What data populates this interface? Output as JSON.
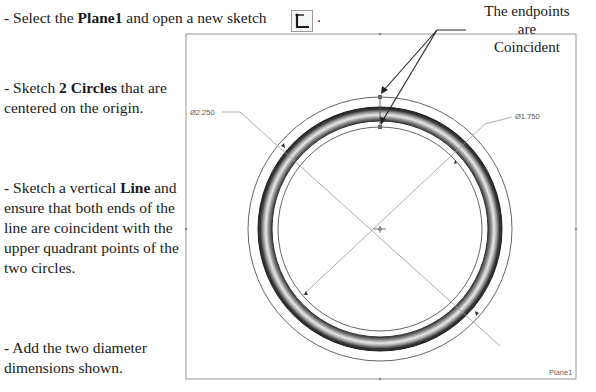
{
  "instructions": {
    "step1": {
      "prefix": "- Select the ",
      "bold": "Plane1",
      "suffix": " and open a new sketch",
      "icon": "sketch-icon",
      "end": "."
    },
    "step2": {
      "prefix": "- Sketch ",
      "bold": "2 Circles",
      "suffix": " that are centered on the origin."
    },
    "step3": {
      "prefix": "- Sketch a vertical ",
      "bold": "Line",
      "suffix": " and ensure that both ends of the line are coincident with the upper quadrant points of the two circles."
    },
    "step4": {
      "text": "- Add the two diameter dimensions shown."
    }
  },
  "callout": {
    "line1": "The endpoints",
    "line2": "are",
    "line3": "Coincident"
  },
  "drawing": {
    "outer_dimension": "Ø2.250",
    "inner_dimension": "Ø1.750",
    "plane_label": "Plane1",
    "colors": {
      "plane_border": "#8c8c8c",
      "sketch_line": "#6e6e6e",
      "ring_dark": "#2a2a2a",
      "ring_light": "#d8d8d8"
    }
  }
}
